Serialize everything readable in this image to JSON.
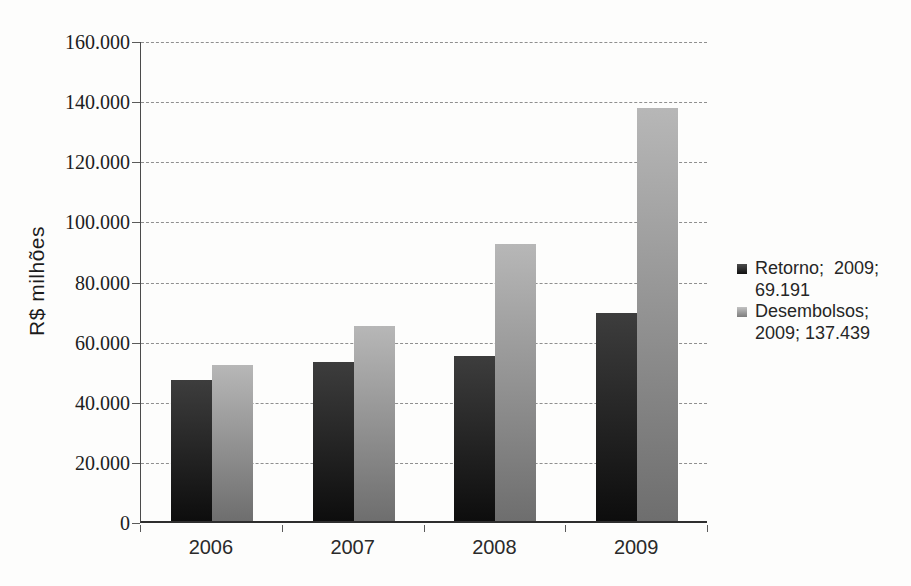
{
  "figure": {
    "background": "#fdfdfc",
    "width": 911,
    "height": 586
  },
  "chart_data": {
    "type": "bar",
    "title": "",
    "xlabel": "",
    "ylabel": "R$ milhões",
    "categories": [
      "2006",
      "2007",
      "2008",
      "2009"
    ],
    "series": [
      {
        "name": "Retorno",
        "values": [
          47000,
          53000,
          55000,
          69191
        ],
        "color_top": "#3d3d3d",
        "color_bottom": "#0d0d0d"
      },
      {
        "name": "Desembolsos",
        "values": [
          52000,
          65000,
          92000,
          137439
        ],
        "color_top": "#b7b7b7",
        "color_bottom": "#6e6e6e"
      }
    ],
    "ylim": [
      0,
      160000
    ],
    "ytick_step": 20000,
    "ytick_labels": [
      "0",
      "20.000",
      "40.000",
      "60.000",
      "80.000",
      "100.000",
      "120.000",
      "140.000",
      "160.000"
    ],
    "grid": "horizontal-dashed",
    "gridline_color": "#8f8f8f",
    "axis_color": "#3a3a3a",
    "legend_position": "right",
    "legend_items": [
      {
        "series": "Retorno",
        "lines": [
          "Retorno;  2009;",
          "69.191"
        ],
        "marker_color_top": "#4c4c4c",
        "marker_color_bottom": "#101010"
      },
      {
        "series": "Desembolsos",
        "lines": [
          "Desembolsos;",
          "2009; 137.439"
        ],
        "marker_color_top": "#c2c2c2",
        "marker_color_bottom": "#7d7d7d"
      }
    ]
  }
}
